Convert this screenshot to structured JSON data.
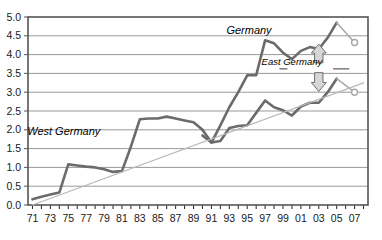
{
  "chart_data": {
    "type": "line",
    "title": "",
    "xlabel": "",
    "ylabel": "",
    "xlim": [
      1970.5,
      2008.5
    ],
    "ylim": [
      0.0,
      5.0
    ],
    "grid": true,
    "legend_position": "inline-annotations",
    "y_ticks": [
      "0.0",
      "0.5",
      "1.0",
      "1.5",
      "2.0",
      "2.5",
      "3.0",
      "3.5",
      "4.0",
      "4.5",
      "5.0"
    ],
    "y_tick_values": [
      0.0,
      0.5,
      1.0,
      1.5,
      2.0,
      2.5,
      3.0,
      3.5,
      4.0,
      4.5,
      5.0
    ],
    "x_ticks": [
      "71",
      "73",
      "75",
      "77",
      "79",
      "81",
      "83",
      "85",
      "87",
      "89",
      "91",
      "93",
      "95",
      "97",
      "99",
      "01",
      "03",
      "05",
      "07"
    ],
    "x_tick_values": [
      1971,
      1973,
      1975,
      1977,
      1979,
      1981,
      1983,
      1985,
      1987,
      1989,
      1991,
      1993,
      1995,
      1997,
      1999,
      2001,
      2003,
      2005,
      2007
    ],
    "x_minor_values": [
      1971,
      1972,
      1973,
      1974,
      1975,
      1976,
      1977,
      1978,
      1979,
      1980,
      1981,
      1982,
      1983,
      1984,
      1985,
      1986,
      1987,
      1988,
      1989,
      1990,
      1991,
      1992,
      1993,
      1994,
      1995,
      1996,
      1997,
      1998,
      1999,
      2000,
      2001,
      2002,
      2003,
      2004,
      2005,
      2006,
      2007,
      2008
    ],
    "series": [
      {
        "name": "West Germany",
        "label": "West Germany",
        "color": "#6b6b6b",
        "style": "solid",
        "x": [
          1971,
          1972,
          1973,
          1974,
          1975,
          1976,
          1977,
          1978,
          1979,
          1980,
          1981,
          1982,
          1983,
          1984,
          1985,
          1986,
          1987,
          1988,
          1989,
          1990
        ],
        "values": [
          0.15,
          0.22,
          0.28,
          0.33,
          1.08,
          1.05,
          1.02,
          1.0,
          0.95,
          0.88,
          0.9,
          1.55,
          2.28,
          2.3,
          2.3,
          2.35,
          2.3,
          2.25,
          2.2,
          2.0
        ]
      },
      {
        "name": "Germany",
        "label": "Germany",
        "color": "#6b6b6b",
        "style": "solid",
        "x": [
          1990,
          1991,
          1992,
          1993,
          1994,
          1995,
          1996,
          1997,
          1998,
          1999,
          2000,
          2001,
          2002,
          2003,
          2004,
          2005
        ],
        "values": [
          2.0,
          1.66,
          2.12,
          2.6,
          3.0,
          3.45,
          3.45,
          4.38,
          4.3,
          4.05,
          3.88,
          4.1,
          4.2,
          4.15,
          4.45,
          4.85
        ]
      },
      {
        "name": "Germany forecast",
        "label": "",
        "color": "#a8a8a8",
        "style": "forecast",
        "x": [
          2005,
          2007
        ],
        "values": [
          4.85,
          4.32
        ],
        "marker": "open-circle"
      },
      {
        "name": "East Germany",
        "label": "East Germany",
        "color": "#6b6b6b",
        "style": "solid",
        "x": [
          1990,
          1991,
          1992,
          1993,
          1994,
          1995,
          1996,
          1997,
          1998,
          1999,
          2000,
          2001,
          2002,
          2003,
          2004,
          2005
        ],
        "values": [
          1.85,
          1.66,
          1.7,
          2.05,
          2.1,
          2.12,
          2.45,
          2.78,
          2.6,
          2.52,
          2.38,
          2.62,
          2.72,
          2.72,
          3.0,
          3.36
        ]
      },
      {
        "name": "East Germany forecast",
        "label": "",
        "color": "#a8a8a8",
        "style": "forecast",
        "x": [
          2005,
          2007
        ],
        "values": [
          3.36,
          3.0
        ],
        "marker": "open-circle"
      },
      {
        "name": "Trend line",
        "label": "",
        "color": "#b9b9b9",
        "style": "thin-solid",
        "x": [
          1971,
          2008
        ],
        "values": [
          0.0,
          3.25
        ]
      }
    ],
    "annotations": [
      {
        "name": "germany-label",
        "text": "Germany",
        "x": 1995.2,
        "y": 4.55
      },
      {
        "name": "east-germany-label",
        "text": "East Germany",
        "x": 2000.0,
        "y": 3.72
      },
      {
        "name": "west-germany-label",
        "text": "West Germany",
        "x": 1974.5,
        "y": 1.85
      },
      {
        "name": "up-arrow",
        "text": "",
        "x": 2003.0,
        "y": 4.1
      },
      {
        "name": "down-arrow",
        "text": "",
        "x": 2003.0,
        "y": 3.35
      }
    ],
    "colors": {
      "plot_border": "#555555",
      "gridline": "#999999",
      "series_dark": "#6b6b6b",
      "series_light": "#a8a8a8",
      "trend": "#b9b9b9",
      "text": "#1a1a1a",
      "background": "#ffffff"
    }
  }
}
